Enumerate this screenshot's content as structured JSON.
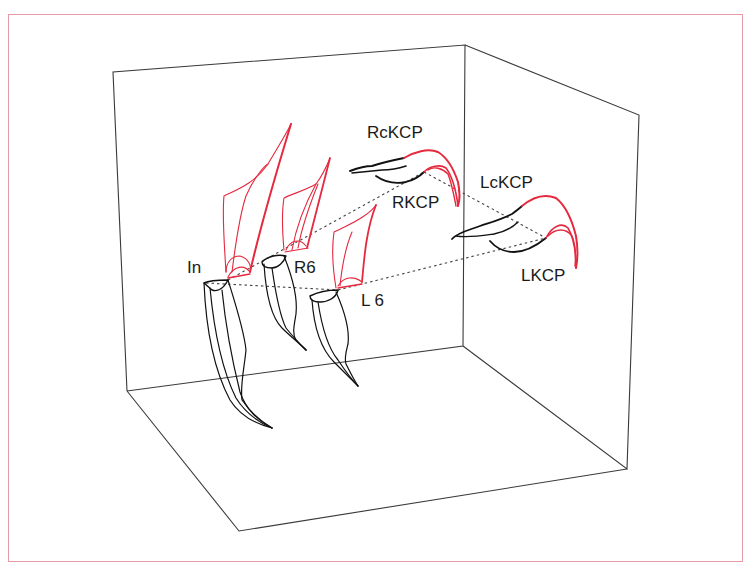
{
  "figure": {
    "type": "3d-tooth-trajectory-diagram",
    "colors": {
      "frame": "#e59aa6",
      "box": "#3a3a3a",
      "initial": "#111111",
      "final": "#e5293f",
      "dash": "#444444"
    },
    "box": {
      "back_wall": [
        [
          113,
          72
        ],
        [
          465,
          45
        ],
        [
          463,
          346
        ],
        [
          127,
          391
        ]
      ],
      "right_wall": [
        [
          465,
          45
        ],
        [
          639,
          115
        ],
        [
          627,
          469
        ],
        [
          463,
          346
        ]
      ],
      "floor": [
        [
          127,
          391
        ],
        [
          239,
          531
        ],
        [
          627,
          469
        ],
        [
          463,
          346
        ]
      ]
    },
    "labels": [
      {
        "id": "In",
        "text": "In",
        "x": 187,
        "y": 273
      },
      {
        "id": "R6",
        "text": "R6",
        "x": 294,
        "y": 273
      },
      {
        "id": "L6",
        "text": "L 6",
        "x": 361,
        "y": 306
      },
      {
        "id": "RcKCP",
        "text": "RcKCP",
        "x": 367,
        "y": 138
      },
      {
        "id": "RKCP",
        "text": "RKCP",
        "x": 392,
        "y": 208
      },
      {
        "id": "LcKCP",
        "text": "LcKCP",
        "x": 480,
        "y": 188
      },
      {
        "id": "LKCP",
        "text": "LKCP",
        "x": 521,
        "y": 281
      }
    ],
    "dashed_links": [
      {
        "from": "In",
        "to": "RKCP",
        "points": [
          [
            228,
            280
          ],
          [
            424,
            172
          ]
        ]
      },
      {
        "from": "In",
        "to": "L6",
        "points": [
          [
            228,
            280
          ],
          [
            338,
            290
          ]
        ]
      },
      {
        "from": "L6",
        "to": "LKCP",
        "points": [
          [
            338,
            290
          ],
          [
            546,
            238
          ]
        ]
      },
      {
        "from": "RKCP",
        "to": "LKCP",
        "points": [
          [
            424,
            172
          ],
          [
            546,
            238
          ]
        ]
      }
    ]
  }
}
